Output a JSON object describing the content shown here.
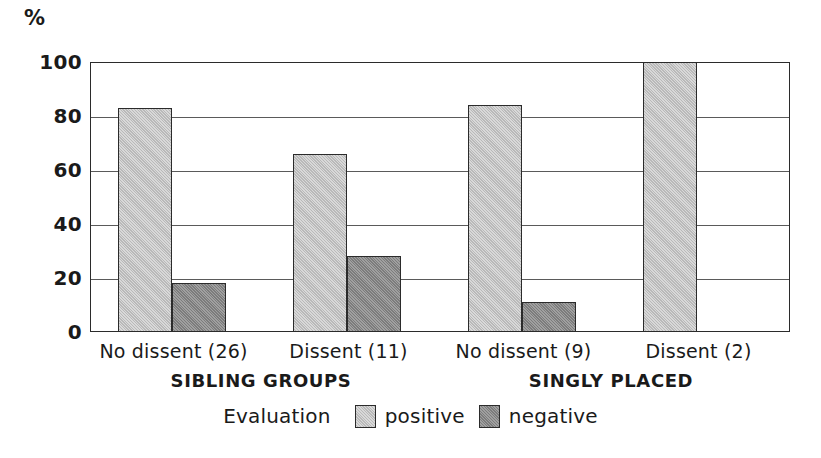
{
  "chart_data": {
    "type": "bar",
    "title": "",
    "subtitle": "",
    "xlabel": "",
    "ylabel": "%",
    "ylim": [
      0,
      100
    ],
    "yticks": [
      0,
      20,
      40,
      60,
      80,
      100
    ],
    "grid": true,
    "legend_position": "bottom-center",
    "legend_title": "Evaluation",
    "categories": [
      "No dissent (26)",
      "Dissent (11)",
      "No dissent (9)",
      "Dissent (2)"
    ],
    "series": [
      {
        "name": "positive",
        "color": "#b9b9b9",
        "values": [
          83,
          66,
          84,
          100
        ]
      },
      {
        "name": "negative",
        "color": "#7c7c7c",
        "values": [
          18,
          28,
          11,
          0
        ]
      }
    ],
    "groups": [
      {
        "label": "SIBLING GROUPS",
        "categories": [
          "No dissent (26)",
          "Dissent (11)"
        ]
      },
      {
        "label": "SINGLY PLACED",
        "categories": [
          "No dissent (9)",
          "Dissent (2)"
        ]
      }
    ],
    "annotations": []
  },
  "axis": {
    "unit_label": "%"
  },
  "colors": {
    "positive": "#b9b9b9",
    "negative": "#7c7c7c",
    "outline": "#2b2b2b",
    "gridline": "#5a5a5a",
    "background": "#ffffff"
  }
}
